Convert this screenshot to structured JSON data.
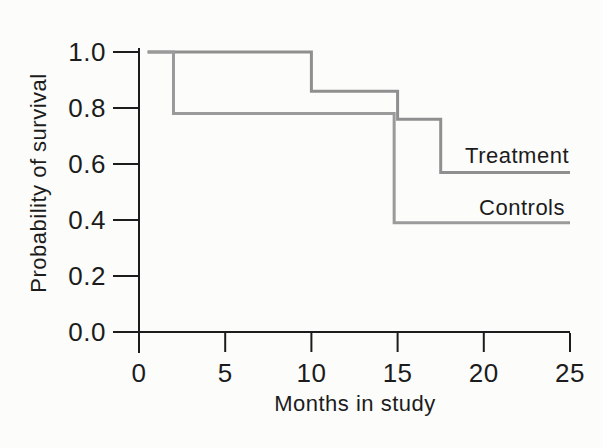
{
  "figure": {
    "background_color": "#fcfcfb",
    "axis_color": "#1c1c1c",
    "text_color": "#1c1c1c"
  },
  "chart_data": {
    "type": "line",
    "subtype": "step-survival",
    "title": "",
    "xlabel": "Months in study",
    "ylabel": "Probability of survival",
    "xlim": [
      0,
      25
    ],
    "ylim": [
      0.0,
      1.0
    ],
    "x_ticks": [
      0,
      5,
      10,
      15,
      20,
      25
    ],
    "y_ticks": [
      "0.0",
      "0.2",
      "0.4",
      "0.6",
      "0.8",
      "1.0"
    ],
    "grid": false,
    "legend_position": "inline-right-of-curves",
    "series": [
      {
        "name": "Treatment",
        "color": "#8f8f8f",
        "points": [
          [
            0.5,
            1.0
          ],
          [
            10,
            1.0
          ],
          [
            10,
            0.86
          ],
          [
            15,
            0.86
          ],
          [
            15,
            0.76
          ],
          [
            17.5,
            0.76
          ],
          [
            17.5,
            0.57
          ],
          [
            25,
            0.57
          ]
        ]
      },
      {
        "name": "Controls",
        "color": "#9a9a9a",
        "points": [
          [
            0.5,
            1.0
          ],
          [
            2,
            1.0
          ],
          [
            2,
            0.78
          ],
          [
            14.8,
            0.78
          ],
          [
            14.8,
            0.39
          ],
          [
            25,
            0.39
          ]
        ]
      }
    ]
  }
}
